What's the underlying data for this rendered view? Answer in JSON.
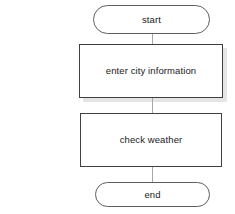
{
  "diagram": {
    "type": "flowchart",
    "orientation": "vertical",
    "background_color": "#ffffff",
    "node_border_color": "#3c4043",
    "terminator_border_color": "#5a5f63",
    "connector_color": "#a8a8a8",
    "text_color": "#1a1a1a",
    "nodes": [
      {
        "id": "start",
        "label": "start",
        "shape": "terminator",
        "shadow": false
      },
      {
        "id": "enter-city-information",
        "label": "enter city information",
        "shape": "process",
        "shadow": true
      },
      {
        "id": "check-weather",
        "label": "check weather",
        "shape": "process",
        "shadow": false
      },
      {
        "id": "end",
        "label": "end",
        "shape": "terminator",
        "shadow": false
      }
    ],
    "connectors": [
      {
        "id": "start-to-enter-city",
        "from": "start",
        "to": "enter-city-information"
      },
      {
        "id": "enter-city-to-check-wx",
        "from": "enter-city-information",
        "to": "check-weather"
      },
      {
        "id": "check-wx-to-end",
        "from": "check-weather",
        "to": "end"
      }
    ]
  }
}
